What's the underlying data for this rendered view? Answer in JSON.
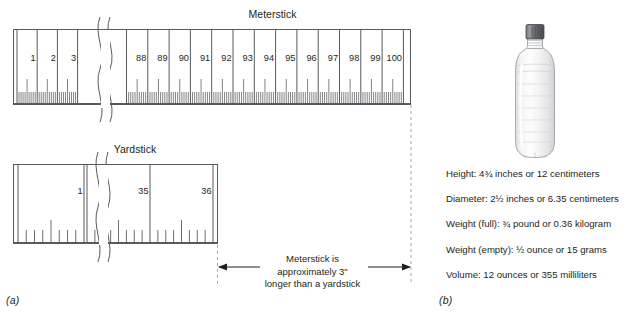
{
  "figure": {
    "panel_a_label": "(a)",
    "panel_b_label": "(b)"
  },
  "meterstick": {
    "title": "Meterstick",
    "left_segment_labels": [
      "1",
      "2",
      "3"
    ],
    "right_segment_labels": [
      "88",
      "89",
      "90",
      "91",
      "92",
      "93",
      "94",
      "95",
      "96",
      "97",
      "98",
      "99",
      "100"
    ],
    "unit": "centimeters",
    "minor_divisions_per_unit": 10,
    "has_break": true
  },
  "yardstick": {
    "title": "Yardstick",
    "left_segment_labels": [
      "1"
    ],
    "right_segment_labels": [
      "35",
      "36"
    ],
    "unit": "inches",
    "minor_divisions_per_unit": 8,
    "has_break": true
  },
  "dimension": {
    "caption_line_1": "Meterstick is",
    "caption_line_2": "approximately 3\"",
    "caption_line_3": "longer than a yardstick"
  },
  "bottle": {
    "name": "plastic-water-bottle",
    "cap_color": "#5f6062",
    "body_color": "#f2f3f3",
    "outline_color": "#9a9b9e",
    "specs": [
      "Height:  4¾  inches or 12 centimeters",
      "Diameter:  2½  inches or 6.35 centimeters",
      "Weight (full):  ¾ pound or 0.36 kilogram",
      "Weight (empty):  ½ ounce or 15 grams",
      "Volume:  12 ounces or 355 milliliters"
    ]
  },
  "colors": {
    "ink": "#231f20",
    "rule_line": "#58595b",
    "tick": "#6d6e71",
    "dashed_guide": "#a7a9ac"
  }
}
